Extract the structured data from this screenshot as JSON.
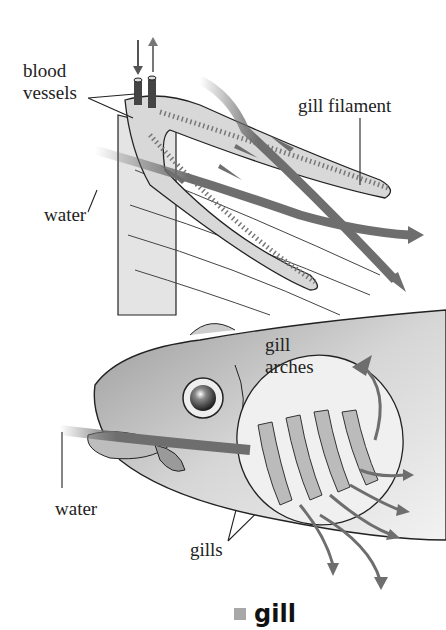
{
  "figure": {
    "labels": {
      "blood_vessels_1": "blood",
      "blood_vessels_2": "vessels",
      "gill_filament": "gill filament",
      "water_top": "water",
      "gill_arches_1": "gill",
      "gill_arches_2": "arches",
      "water_bottom": "water",
      "gills": "gills"
    },
    "caption": {
      "marker_color": "#a8a8a8",
      "text": "gill"
    },
    "colors": {
      "arrow": "#6e6e6e",
      "tissue": "#d8d8d8",
      "vessel": "#444444",
      "line": "#222222"
    }
  }
}
